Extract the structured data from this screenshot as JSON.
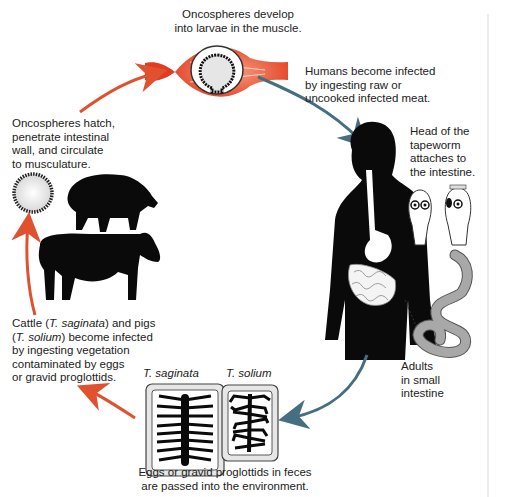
{
  "diagram": {
    "type": "life-cycle",
    "steps": [
      {
        "id": "larvae",
        "text": "Oncospheres develop\ninto larvae in the muscle."
      },
      {
        "id": "human-infection",
        "text": "Humans become infected\nby ingesting raw or\nuncooked infected meat."
      },
      {
        "id": "head-attach",
        "text": "Head of the\ntapeworm\nattaches to\nthe intestine."
      },
      {
        "id": "adults",
        "text": "Adults\nin small\nintestine"
      },
      {
        "id": "eggs",
        "text": "Eggs or gravid proglottids in feces\nare passed into the environment."
      },
      {
        "id": "cattle-pigs",
        "parts": [
          "Cattle (",
          "T. saginata",
          ") and pigs\n(",
          "T. solium",
          ") become infected\nby ingesting vegetation\ncontaminated by eggs\nor gravid proglottids."
        ]
      },
      {
        "id": "hatch",
        "text": "Oncospheres hatch,\npenetrate intestinal\nwall, and circulate\nto musculature."
      }
    ],
    "proglottid_labels": {
      "left": "T. saginata",
      "right": "T. solium"
    },
    "colors": {
      "arrow_red": "#e0522f",
      "arrow_blue": "#466d80",
      "muscle_red": "#e8452a",
      "silhouette": "#0a0a0a",
      "worm_gray": "#a8a8a8"
    }
  }
}
